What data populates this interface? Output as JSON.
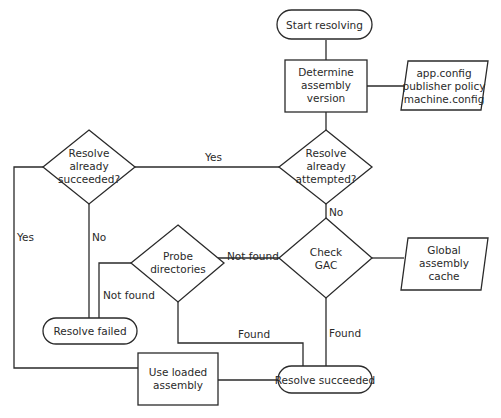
{
  "diagram": {
    "type": "flowchart",
    "nodes": {
      "start": {
        "shape": "terminator",
        "lines": [
          "Start resolving"
        ]
      },
      "determine": {
        "shape": "process",
        "lines": [
          "Determine",
          "assembly",
          "version"
        ]
      },
      "config": {
        "shape": "data",
        "lines": [
          "app.config",
          "publisher policy",
          "machine.config"
        ]
      },
      "attempted": {
        "shape": "decision",
        "lines": [
          "Resolve",
          "already",
          "attempted?"
        ]
      },
      "succeeded_q": {
        "shape": "decision",
        "lines": [
          "Resolve",
          "already",
          "succeeded?"
        ]
      },
      "check_gac": {
        "shape": "decision",
        "lines": [
          "Check",
          "GAC"
        ]
      },
      "gac": {
        "shape": "data",
        "lines": [
          "Global",
          "assembly",
          "cache"
        ]
      },
      "probe": {
        "shape": "decision",
        "lines": [
          "Probe",
          "directories"
        ]
      },
      "failed": {
        "shape": "terminator",
        "lines": [
          "Resolve failed"
        ]
      },
      "use_loaded": {
        "shape": "process",
        "lines": [
          "Use loaded",
          "assembly"
        ]
      },
      "resolved": {
        "shape": "terminator",
        "lines": [
          "Resolve succeeded"
        ]
      }
    },
    "edge_labels": {
      "attempted_yes": "Yes",
      "attempted_no": "No",
      "succeeded_yes": "Yes",
      "succeeded_no": "No",
      "gac_not_found": "Not found",
      "gac_found": "Found",
      "probe_not_found": "Not found",
      "probe_found": "Found"
    }
  }
}
